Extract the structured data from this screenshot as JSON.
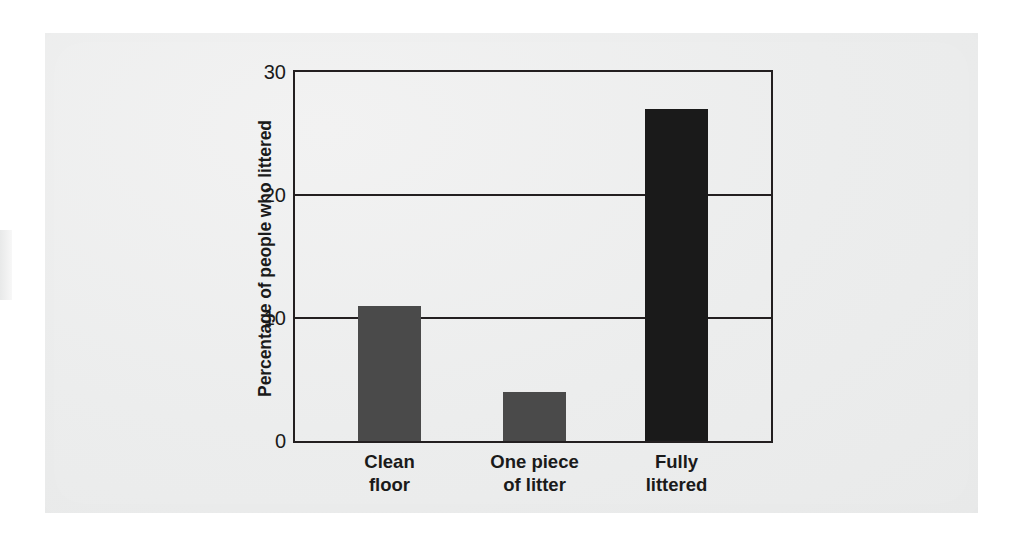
{
  "chart_data": {
    "type": "bar",
    "title": "",
    "subtitle": "",
    "xlabel": "",
    "ylabel": "Percentage of people who littered",
    "categories": [
      "Clean floor",
      "One piece of litter",
      "Fully littered"
    ],
    "category_lines": [
      [
        "Clean",
        "floor"
      ],
      [
        "One piece",
        "of litter"
      ],
      [
        "Fully",
        "littered"
      ]
    ],
    "values": [
      11,
      4,
      27
    ],
    "bar_colors": [
      "#4a4a4a",
      "#4a4a4a",
      "#1a1a1a"
    ],
    "ylim": [
      0,
      30
    ],
    "yticks": [
      0,
      10,
      20,
      30
    ],
    "ytick_labels": [
      "0",
      "10",
      "20",
      "30"
    ],
    "grid": true,
    "gridlines_at": [
      10,
      20
    ],
    "legend": "none",
    "annotations": []
  },
  "colors": {
    "bar_gray": "#4a4a4a",
    "bar_dark": "#1a1a1a",
    "axis": "#231f20",
    "paper": "#eceded",
    "text": "#1a1a1a"
  }
}
